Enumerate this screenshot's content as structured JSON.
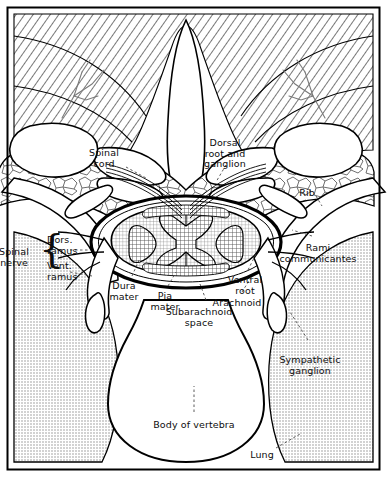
{
  "figure": {
    "frame_color": "#000000",
    "background": "#ffffff"
  },
  "textures": {
    "muscle": {
      "name": "diagonal-hatch",
      "color": "#555555"
    },
    "cancellous_bone": {
      "name": "trabecular-cells",
      "color": "#6a6a6a"
    },
    "lung": {
      "name": "fine-stipple",
      "color": "#8a8a8a"
    },
    "grey_matter": {
      "name": "cross-hatch",
      "color": "#4a4a4a"
    },
    "white_matter": {
      "name": "fine-grid",
      "color": "#777777"
    }
  },
  "labels": [
    {
      "id": "spinal-cord",
      "text": "Spinal\ncord",
      "x": 104,
      "y": 148,
      "align": "center"
    },
    {
      "id": "dorsal-root-ganglion",
      "text": "Dorsal\nroot and\nganglion",
      "x": 225,
      "y": 138,
      "align": "center"
    },
    {
      "id": "rib",
      "text": "Rib",
      "x": 307,
      "y": 188,
      "align": "center"
    },
    {
      "id": "spinal-nerve",
      "text": "Spinal\nnerve",
      "x": 14,
      "y": 247,
      "align": "center"
    },
    {
      "id": "dorsal-ramus",
      "text": "Dors.\nramus",
      "x": 47,
      "y": 235,
      "align": "left"
    },
    {
      "id": "ventral-ramus",
      "text": "Vent.\nramus",
      "x": 47,
      "y": 261,
      "align": "left"
    },
    {
      "id": "rami-communicantes",
      "text": "Rami\ncommunicantes",
      "x": 318,
      "y": 243,
      "align": "center"
    },
    {
      "id": "dura-mater",
      "text": "Dura\nmater",
      "x": 124,
      "y": 281,
      "align": "center"
    },
    {
      "id": "pia-mater",
      "text": "Pia\nmater",
      "x": 165,
      "y": 291,
      "align": "center"
    },
    {
      "id": "ventral-root",
      "text": "Ventral\nroot",
      "x": 245,
      "y": 275,
      "align": "center"
    },
    {
      "id": "arachnoid",
      "text": "Arachnoid",
      "x": 237,
      "y": 298,
      "align": "center"
    },
    {
      "id": "subarachnoid-space",
      "text": "Subarachnoid\nspace",
      "x": 199,
      "y": 307,
      "align": "center"
    },
    {
      "id": "sympathetic-ganglion",
      "text": "Sympathetic\nganglion",
      "x": 310,
      "y": 355,
      "align": "center"
    },
    {
      "id": "body-of-vertebra",
      "text": "Body of vertebra",
      "x": 194,
      "y": 420,
      "align": "center"
    },
    {
      "id": "lung",
      "text": "Lung",
      "x": 262,
      "y": 450,
      "align": "center"
    }
  ],
  "structures": [
    {
      "id": "spinous-process",
      "name": "spinous process"
    },
    {
      "id": "vertebral-body",
      "name": "body of vertebra"
    },
    {
      "id": "transverse-process",
      "name": "transverse process"
    },
    {
      "id": "rib-left",
      "name": "rib (left)"
    },
    {
      "id": "rib-right",
      "name": "rib (right)"
    },
    {
      "id": "lung-left",
      "name": "lung (left)"
    },
    {
      "id": "lung-right",
      "name": "lung (right)"
    },
    {
      "id": "erector-spinae",
      "name": "deep back muscle"
    },
    {
      "id": "spinal-cord-core",
      "name": "spinal cord"
    },
    {
      "id": "dura-sac",
      "name": "dural sac"
    }
  ]
}
